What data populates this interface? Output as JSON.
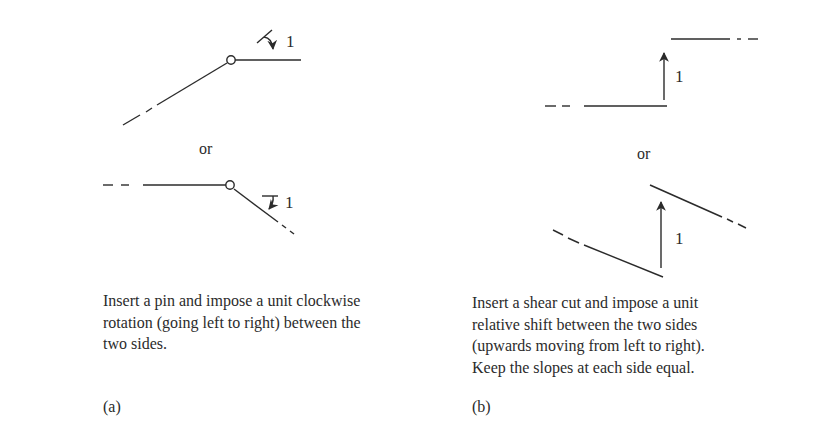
{
  "panel_a": {
    "caption_label": "(a)",
    "or_label": "or",
    "top_diagram": {
      "rotation_label": "1",
      "hinge": "pin",
      "description": "Inclined member rising to a pin, then horizontal; clockwise unit rotation arrow"
    },
    "bottom_diagram": {
      "rotation_label": "1",
      "hinge": "pin",
      "description": "Horizontal member to a pin, then sloping downward; clockwise unit rotation arrow"
    },
    "description_lines": [
      "Insert a pin and impose a unit clockwise",
      "rotation (going left to right) between the",
      "two sides."
    ]
  },
  "panel_b": {
    "caption_label": "(b)",
    "or_label": "or",
    "top_diagram": {
      "shift_label": "1",
      "description": "Horizontal left segment, vertical unit shift arrow up, horizontal right segment raised"
    },
    "bottom_diagram": {
      "shift_label": "1",
      "description": "Parallel sloping segments offset by a vertical unit shift arrow"
    },
    "description_lines": [
      "Insert a shear cut and impose a unit",
      "relative shift between the two sides",
      "(upwards moving from left to right).",
      "Keep the slopes at each side equal."
    ]
  },
  "colors": {
    "stroke": "#2b2b2b",
    "background": "#ffffff"
  }
}
